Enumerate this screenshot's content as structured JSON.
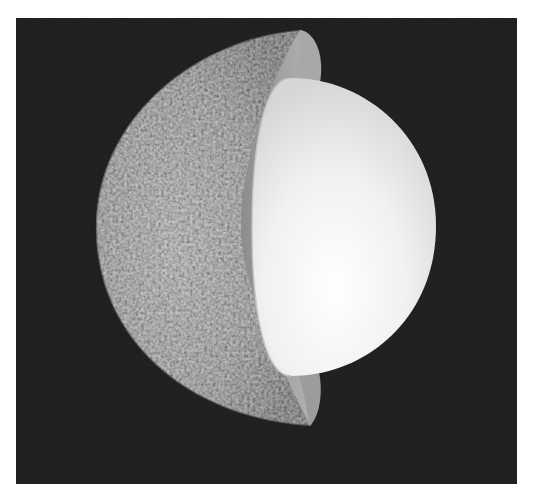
{
  "image": {
    "subject": "Cutaway illustration of planet Mercury showing its large metallic core",
    "alt_text": "Mercury cutaway: cratered gray surface on the left, thin mantle layer, and large bright core filling most of the interior"
  },
  "colors": {
    "background": "#1c1c1c",
    "surface_dark": "#5a5a5a",
    "surface_mid": "#8a8a8a",
    "surface_light": "#c8c8c8",
    "mantle": "#9a9a9a",
    "mantle_light": "#b4b4b4",
    "core_light": "#f6f6f6",
    "core_shade": "#dcdcdc",
    "page_border": "#ffffff"
  },
  "layers": [
    {
      "name": "crust-surface",
      "label": "Cratered surface"
    },
    {
      "name": "mantle",
      "label": "Mantle"
    },
    {
      "name": "core",
      "label": "Core"
    }
  ]
}
